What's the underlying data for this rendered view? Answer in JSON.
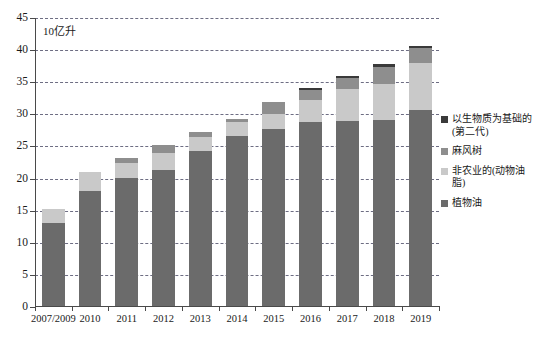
{
  "chart_data": {
    "type": "bar",
    "subtype": "stacked-bar",
    "title": "",
    "unit_label": "10亿升",
    "xlabel": "",
    "ylabel": "",
    "ylim": [
      0,
      45
    ],
    "ytick_step": 5,
    "yticks": [
      "0",
      "5",
      "10",
      "15",
      "20",
      "25",
      "30",
      "35",
      "40",
      "45"
    ],
    "grid": true,
    "grid_style": "dashed-horizontal",
    "legend_position": "right",
    "categories": [
      "2007/2009",
      "2010",
      "2011",
      "2012",
      "2013",
      "2014",
      "2015",
      "2016",
      "2017",
      "2018",
      "2019"
    ],
    "series": [
      {
        "name": "植物油",
        "color": "#6b6b6b",
        "values": [
          13.1,
          18.0,
          20.1,
          21.4,
          24.3,
          26.6,
          27.7,
          28.8,
          29.0,
          29.1,
          30.6
        ]
      },
      {
        "name": "非农业的(动物油脂)",
        "color": "#c9c9c9",
        "values": [
          2.1,
          3.1,
          2.4,
          2.6,
          2.2,
          2.2,
          2.4,
          3.5,
          5.0,
          5.7,
          7.4
        ]
      },
      {
        "name": "麻风树",
        "color": "#8e8e8e",
        "values": [
          0.0,
          0.0,
          0.7,
          1.2,
          0.7,
          0.4,
          1.8,
          1.5,
          1.6,
          2.5,
          2.3
        ]
      },
      {
        "name": "以生物质为基础的(第二代)",
        "color": "#3a3a3a",
        "values": [
          0.0,
          0.0,
          0.0,
          0.0,
          0.0,
          0.0,
          0.0,
          0.3,
          0.3,
          0.5,
          0.3
        ]
      }
    ],
    "totals": [
      15.2,
      21.1,
      23.2,
      25.2,
      27.2,
      29.2,
      31.9,
      34.1,
      35.9,
      37.8,
      40.6
    ]
  },
  "legend": {
    "items": [
      {
        "label": "以生物质为基础的(第二代)",
        "color": "#3a3a3a"
      },
      {
        "label": "麻风树",
        "color": "#8e8e8e"
      },
      {
        "label": "非农业的(动物油脂)",
        "color": "#c9c9c9"
      },
      {
        "label": "植物油",
        "color": "#6b6b6b"
      }
    ]
  },
  "colors": {
    "axis": "#4a4a4a",
    "grid": "#6d6d83",
    "background": "#ffffff",
    "text": "#1a1a1a"
  }
}
